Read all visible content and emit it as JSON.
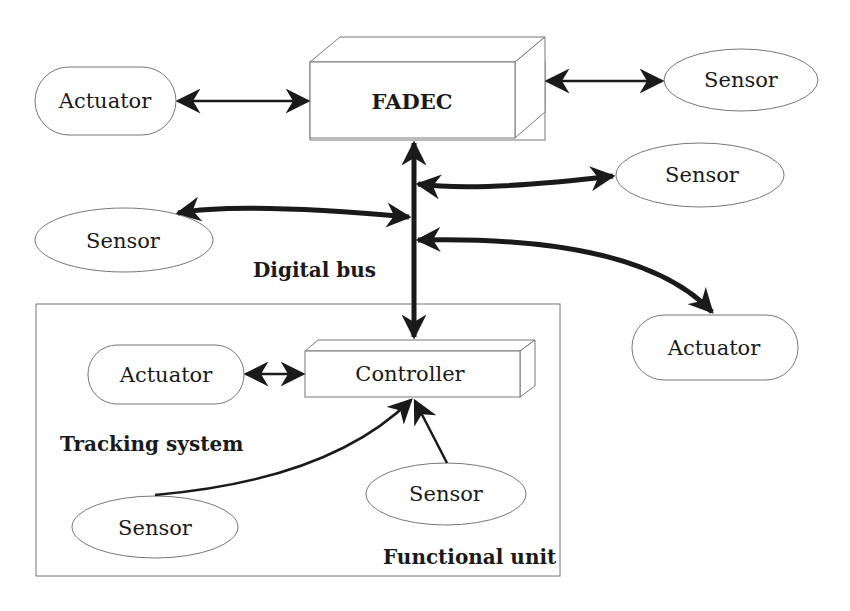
{
  "diagram": {
    "nodes": {
      "fadec": {
        "label": "FADEC",
        "shape": "3d-box"
      },
      "actuator_top": {
        "label": "Actuator",
        "shape": "rounded"
      },
      "sensor_top_right": {
        "label": "Sensor",
        "shape": "ellipse"
      },
      "sensor_mid_right": {
        "label": "Sensor",
        "shape": "ellipse"
      },
      "sensor_mid_left": {
        "label": "Sensor",
        "shape": "ellipse"
      },
      "actuator_right": {
        "label": "Actuator",
        "shape": "rounded"
      },
      "controller": {
        "label": "Controller",
        "shape": "3d-box"
      },
      "actuator_inner": {
        "label": "Actuator",
        "shape": "rounded"
      },
      "sensor_inner_left": {
        "label": "Sensor",
        "shape": "ellipse"
      },
      "sensor_inner_right": {
        "label": "Sensor",
        "shape": "ellipse"
      }
    },
    "labels": {
      "digital_bus": "Digital bus",
      "tracking_system": "Tracking system",
      "functional_unit": "Functional unit"
    },
    "edges": [
      {
        "from": "actuator_top",
        "to": "fadec",
        "type": "bidirectional"
      },
      {
        "from": "fadec",
        "to": "sensor_top_right",
        "type": "bidirectional"
      },
      {
        "from": "digital_bus",
        "to": "sensor_mid_right",
        "type": "bidirectional-thick"
      },
      {
        "from": "sensor_mid_left",
        "to": "digital_bus",
        "type": "bidirectional-thick"
      },
      {
        "from": "digital_bus",
        "to": "actuator_right",
        "type": "bidirectional-thick"
      },
      {
        "from": "fadec",
        "to": "controller",
        "type": "bus-bidirectional-thick"
      },
      {
        "from": "actuator_inner",
        "to": "controller",
        "type": "bidirectional"
      },
      {
        "from": "sensor_inner_left",
        "to": "controller",
        "type": "directed"
      },
      {
        "from": "sensor_inner_right",
        "to": "controller",
        "type": "directed"
      }
    ]
  }
}
